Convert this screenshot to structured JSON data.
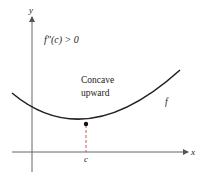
{
  "diagram": {
    "condition_label": "f″(c) > 0",
    "region_label_line1": "Concave",
    "region_label_line2": "upward",
    "curve_label": "f",
    "x_axis_label": "x",
    "y_axis_label": "y",
    "point_label": "c",
    "colors": {
      "curve": "#222222",
      "axes": "#555555",
      "dashed_line": "#d9534f",
      "point": "#111111"
    }
  }
}
